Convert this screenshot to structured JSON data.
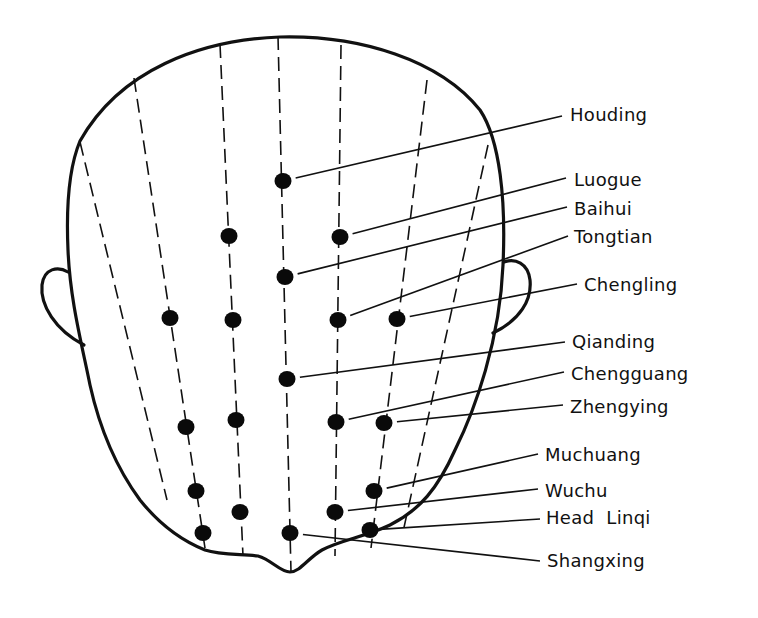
{
  "diagram": {
    "title": "",
    "colors": {
      "line": "#111111",
      "point": "#0a0a0a",
      "background": "#ffffff"
    },
    "labels": [
      {
        "id": "houding",
        "text": "Houding",
        "x": 570,
        "y": 121,
        "anchor": [
          562,
          116
        ],
        "point": [
          283,
          181
        ]
      },
      {
        "id": "luogue",
        "text": "Luogue",
        "x": 574,
        "y": 186,
        "anchor": [
          566,
          178
        ],
        "point": [
          340,
          237
        ]
      },
      {
        "id": "baihui",
        "text": "Baihui",
        "x": 574,
        "y": 215,
        "anchor": [
          567,
          207
        ],
        "point": [
          285,
          277
        ]
      },
      {
        "id": "tongtian",
        "text": "Tongtian",
        "x": 574,
        "y": 243,
        "anchor": [
          568,
          236
        ],
        "point": [
          338,
          320
        ]
      },
      {
        "id": "chengling",
        "text": "Chengling",
        "x": 584,
        "y": 291,
        "anchor": [
          577,
          284
        ],
        "point": [
          397,
          319
        ]
      },
      {
        "id": "qianding",
        "text": "Qianding",
        "x": 572,
        "y": 348,
        "anchor": [
          565,
          342
        ],
        "point": [
          287,
          379
        ]
      },
      {
        "id": "chengguang",
        "text": "Chengguang",
        "x": 571,
        "y": 380,
        "anchor": [
          564,
          372
        ],
        "point": [
          336,
          422
        ]
      },
      {
        "id": "zhengying",
        "text": "Zhengying",
        "x": 570,
        "y": 413,
        "anchor": [
          563,
          405
        ],
        "point": [
          384,
          423
        ]
      },
      {
        "id": "muchuang",
        "text": "Muchuang",
        "x": 545,
        "y": 461,
        "anchor": [
          538,
          454
        ],
        "point": [
          374,
          491
        ]
      },
      {
        "id": "wuchu",
        "text": "Wuchu",
        "x": 545,
        "y": 497,
        "anchor": [
          538,
          489
        ],
        "point": [
          335,
          512
        ]
      },
      {
        "id": "head_linqi",
        "text": "Head  Linqi",
        "x": 546,
        "y": 524,
        "anchor": [
          540,
          519
        ],
        "point": [
          370,
          530
        ]
      },
      {
        "id": "shangxing",
        "text": "Shangxing",
        "x": 547,
        "y": 567,
        "anchor": [
          540,
          561
        ],
        "point": [
          290,
          533
        ]
      }
    ],
    "unlabeled_points": [
      [
        229,
        236
      ],
      [
        233,
        320
      ],
      [
        170,
        318
      ],
      [
        236,
        420
      ],
      [
        186,
        427
      ],
      [
        196,
        491
      ],
      [
        240,
        512
      ],
      [
        203,
        533
      ]
    ]
  }
}
